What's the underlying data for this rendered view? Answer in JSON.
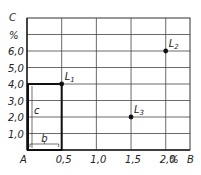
{
  "chart_data": {
    "type": "scatter",
    "title": "",
    "xlabel": "B",
    "ylabel": "C",
    "origin_label": "A",
    "x_unit": "%",
    "y_unit": "%",
    "xlim": [
      0,
      2.35
    ],
    "ylim": [
      0,
      8.0
    ],
    "x_ticks": [
      {
        "value": 0.5,
        "label": "0,5"
      },
      {
        "value": 1.0,
        "label": "1,0"
      },
      {
        "value": 1.5,
        "label": "1,5"
      },
      {
        "value": 2.0,
        "label": "2,0"
      }
    ],
    "y_ticks": [
      {
        "value": 1.0,
        "label": "1,0"
      },
      {
        "value": 2.0,
        "label": "2,0"
      },
      {
        "value": 3.0,
        "label": "3,0"
      },
      {
        "value": 4.0,
        "label": "4,0"
      },
      {
        "value": 5.0,
        "label": "5,0"
      },
      {
        "value": 6.0,
        "label": "6,0"
      }
    ],
    "grid": true,
    "points": [
      {
        "name": "L",
        "sub": "1",
        "x": 0.5,
        "y": 4.0
      },
      {
        "name": "L",
        "sub": "2",
        "x": 2.0,
        "y": 6.0
      },
      {
        "name": "L",
        "sub": "3",
        "x": 1.5,
        "y": 2.0
      }
    ],
    "rectangle": {
      "x0": 0,
      "y0": 0,
      "x1": 0.5,
      "y1": 4.0
    },
    "annotations": [
      {
        "text": "b",
        "meaning": "width of rectangle along B"
      },
      {
        "text": "c",
        "meaning": "height of rectangle along C"
      }
    ]
  }
}
